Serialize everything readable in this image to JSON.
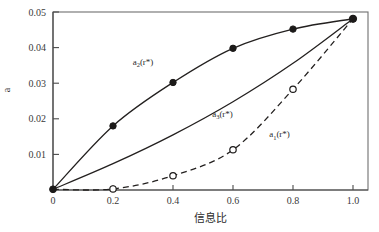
{
  "chart_data": {
    "type": "line",
    "title": "",
    "xlabel": "信息比",
    "ylabel": "a",
    "xlim": [
      0,
      1.05
    ],
    "ylim": [
      0,
      0.05
    ],
    "grid": false,
    "legend": "inline-annotations",
    "x_ticks": [
      "0",
      "0.2",
      "0.4",
      "0.6",
      "0.8",
      "1.0"
    ],
    "x_tick_values": [
      0,
      0.2,
      0.4,
      0.6,
      0.8,
      1.0
    ],
    "y_ticks": [
      "0.01",
      "0.02",
      "0.03",
      "0.04",
      "0.05"
    ],
    "y_tick_values": [
      0.01,
      0.02,
      0.03,
      0.04,
      0.05
    ],
    "x": [
      0,
      0.2,
      0.4,
      0.6,
      0.8,
      1.0
    ],
    "series": [
      {
        "name": "a2(r*)",
        "label_main": "a",
        "label_sub": "2",
        "label_tail": "(r*)",
        "style": "solid",
        "marker": "filled-circle",
        "values": [
          0.0002,
          0.018,
          0.0302,
          0.0398,
          0.0452,
          0.0481
        ],
        "label_x": 0.3,
        "label_y": 0.0352
      },
      {
        "name": "a3(r*)",
        "label_main": "a",
        "label_sub": "3",
        "label_tail": "(r*)",
        "style": "solid",
        "marker": "none",
        "values": [
          0.0002,
          0.0074,
          0.0155,
          0.0248,
          0.0356,
          0.0481
        ],
        "label_x": 0.565,
        "label_y": 0.0205
      },
      {
        "name": "a1(r*)",
        "label_main": "a",
        "label_sub": "1",
        "label_tail": "(r*)",
        "style": "dashed",
        "marker": "open-circle",
        "values": [
          0.0002,
          0.0003,
          0.004,
          0.0113,
          0.0283,
          0.0481
        ],
        "label_x": 0.755,
        "label_y": 0.0148
      }
    ],
    "shared_endpoint": {
      "x": 1.0,
      "y": 0.0481,
      "marker": "filled-circle"
    },
    "colors": {
      "line": "#23201f",
      "frame": "#6f6f6f",
      "axis": "#4a4a4a",
      "text": "#2b2b2b",
      "background": "#ffffff"
    }
  }
}
